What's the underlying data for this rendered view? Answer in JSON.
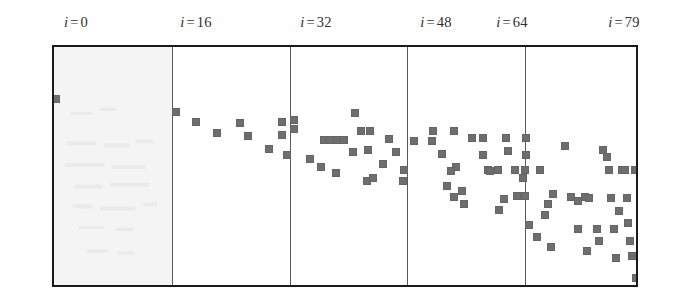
{
  "figure": {
    "kind": "sparsity-scatter-panels",
    "background_color": "#ffffff",
    "frame_color": "#1a1a1a",
    "divider_color": "#5a5a5a",
    "marker_color": "#6e6e6e",
    "first_panel_tint": "#f2f2f2"
  },
  "axis_labels": [
    {
      "var": "i",
      "eq": "=",
      "value": "0",
      "text": "i = 0",
      "x": 76
    },
    {
      "var": "i",
      "eq": "=",
      "value": "16",
      "text": "i = 16",
      "x": 196
    },
    {
      "var": "i",
      "eq": "=",
      "value": "32",
      "text": "i = 32",
      "x": 316
    },
    {
      "var": "i",
      "eq": "=",
      "value": "48",
      "text": "i = 48",
      "x": 436
    },
    {
      "var": "i",
      "eq": "=",
      "value": "64",
      "text": "i = 64",
      "x": 512
    },
    {
      "var": "i",
      "eq": "=",
      "value": "79",
      "text": "i = 79",
      "x": 624
    }
  ],
  "plot": {
    "left": 52,
    "top": 45,
    "width": 586,
    "height": 242,
    "dividers": [
      118,
      236,
      353,
      471
    ],
    "tint_panel": {
      "x": 0,
      "width": 118
    }
  },
  "chart_data": {
    "type": "scatter",
    "title": "",
    "xlabel": "",
    "ylabel": "",
    "xlim": [
      0,
      79
    ],
    "ylim": [
      0,
      242
    ],
    "grid": false,
    "legend": "none",
    "marker": "square",
    "marker_size_px": 8,
    "panel_boundaries_i": [
      0,
      16,
      32,
      48,
      64,
      79
    ],
    "note": "Coordinates are marker top-left positions in pixels relative to the plot interior (586x242).",
    "points": [
      [
        -2,
        48
      ],
      [
        118,
        61
      ],
      [
        138,
        71
      ],
      [
        159,
        82
      ],
      [
        182,
        72
      ],
      [
        190,
        85
      ],
      [
        211,
        98
      ],
      [
        224,
        71
      ],
      [
        224,
        84
      ],
      [
        236,
        69
      ],
      [
        236,
        78
      ],
      [
        229,
        104
      ],
      [
        252,
        108
      ],
      [
        263,
        116
      ],
      [
        266,
        89
      ],
      [
        272,
        89
      ],
      [
        279,
        89
      ],
      [
        278,
        122
      ],
      [
        286,
        89
      ],
      [
        295,
        101
      ],
      [
        297,
        62
      ],
      [
        303,
        80
      ],
      [
        312,
        80
      ],
      [
        310,
        99
      ],
      [
        309,
        130
      ],
      [
        315,
        127
      ],
      [
        325,
        113
      ],
      [
        331,
        88
      ],
      [
        338,
        101
      ],
      [
        345,
        130
      ],
      [
        346,
        119
      ],
      [
        356,
        90
      ],
      [
        374,
        90
      ],
      [
        375,
        80
      ],
      [
        384,
        103
      ],
      [
        396,
        80
      ],
      [
        398,
        116
      ],
      [
        396,
        146
      ],
      [
        393,
        120
      ],
      [
        389,
        135
      ],
      [
        404,
        140
      ],
      [
        406,
        153
      ],
      [
        414,
        87
      ],
      [
        425,
        87
      ],
      [
        425,
        104
      ],
      [
        430,
        119
      ],
      [
        432,
        120
      ],
      [
        440,
        119
      ],
      [
        441,
        159
      ],
      [
        446,
        148
      ],
      [
        448,
        87
      ],
      [
        450,
        100
      ],
      [
        457,
        119
      ],
      [
        459,
        145
      ],
      [
        465,
        127
      ],
      [
        468,
        87
      ],
      [
        468,
        104
      ],
      [
        467,
        119
      ],
      [
        467,
        145
      ],
      [
        471,
        174
      ],
      [
        482,
        119
      ],
      [
        479,
        186
      ],
      [
        487,
        164
      ],
      [
        490,
        153
      ],
      [
        493,
        196
      ],
      [
        495,
        143
      ],
      [
        507,
        95
      ],
      [
        513,
        146
      ],
      [
        520,
        150
      ],
      [
        520,
        178
      ],
      [
        527,
        146
      ],
      [
        529,
        200
      ],
      [
        531,
        147
      ],
      [
        539,
        178
      ],
      [
        541,
        190
      ],
      [
        545,
        99
      ],
      [
        549,
        106
      ],
      [
        551,
        119
      ],
      [
        553,
        147
      ],
      [
        556,
        178
      ],
      [
        558,
        207
      ],
      [
        561,
        160
      ],
      [
        564,
        119
      ],
      [
        567,
        119
      ],
      [
        569,
        147
      ],
      [
        570,
        172
      ],
      [
        572,
        190
      ],
      [
        574,
        205
      ],
      [
        577,
        119
      ],
      [
        578,
        119
      ],
      [
        578,
        227
      ]
    ]
  }
}
